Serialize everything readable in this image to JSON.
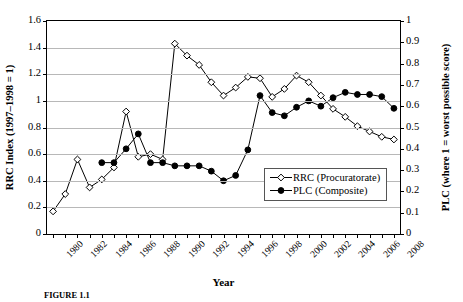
{
  "chart_data": {
    "type": "line",
    "title": "",
    "xlabel": "Year",
    "ylabel": "RRC Index (1997–1998 = 1)",
    "ylabel_right": "PLC (where 1 = worst possible score)",
    "x": [
      1980,
      1981,
      1982,
      1983,
      1984,
      1985,
      1986,
      1987,
      1988,
      1989,
      1990,
      1991,
      1992,
      1993,
      1994,
      1995,
      1996,
      1997,
      1998,
      1999,
      2000,
      2001,
      2002,
      2003,
      2004,
      2005,
      2006,
      2007,
      2008
    ],
    "xlim": [
      1979.5,
      2008.5
    ],
    "ylim": [
      0,
      1.6
    ],
    "ylim_right": [
      0,
      1
    ],
    "yticks": [
      0,
      0.2,
      0.4,
      0.6,
      0.8,
      1,
      1.2,
      1.4,
      1.6
    ],
    "yticks_right": [
      0,
      0.1,
      0.2,
      0.3,
      0.4,
      0.5,
      0.6,
      0.7,
      0.8,
      0.9,
      1
    ],
    "xticks": [
      1980,
      1982,
      1984,
      1986,
      1988,
      1990,
      1992,
      1994,
      1996,
      1998,
      2000,
      2002,
      2004,
      2006,
      2008
    ],
    "xticklabels": [
      "1980",
      "1982",
      "1984",
      "1986",
      "1988",
      "1990",
      "1992",
      "1994",
      "1996",
      "1998",
      "2000",
      "2002",
      "2004",
      "2006",
      "2008"
    ],
    "grid": true,
    "legend_position": "lower-right",
    "series": [
      {
        "name": "RRC (Procuratorate)",
        "axis": "left",
        "marker": "open-diamond",
        "color": "#000000",
        "values": [
          0.17,
          0.3,
          0.56,
          0.35,
          0.41,
          0.5,
          0.92,
          0.58,
          0.6,
          0.56,
          1.43,
          1.34,
          1.27,
          1.14,
          1.04,
          1.1,
          1.18,
          1.17,
          1.03,
          1.09,
          1.19,
          1.14,
          1.04,
          0.94,
          0.88,
          0.81,
          0.77,
          0.73,
          0.71
        ]
      },
      {
        "name": "PLC (Composite)",
        "axis": "right",
        "marker": "filled-circle",
        "color": "#000000",
        "values": [
          null,
          null,
          null,
          null,
          0.335,
          0.335,
          0.4,
          0.47,
          0.335,
          0.335,
          0.32,
          0.32,
          0.32,
          0.295,
          0.25,
          0.275,
          0.395,
          0.65,
          0.57,
          0.555,
          0.595,
          0.625,
          0.6,
          0.64,
          0.665,
          0.655,
          0.655,
          0.645,
          0.59
        ]
      }
    ]
  },
  "legend": {
    "items": [
      {
        "label": "RRC (Procuratorate)",
        "marker": "open-diamond"
      },
      {
        "label": "PLC (Composite)",
        "marker": "filled-circle"
      }
    ]
  },
  "caption": {
    "figure_number": "FIGURE 1.1",
    "text": ""
  }
}
